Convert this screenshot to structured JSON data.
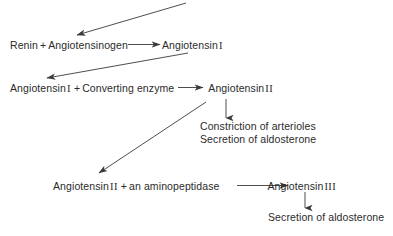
{
  "diagram": {
    "background_color": "#ffffff",
    "text_color": "#2b2b2b",
    "line_color": "#3a3a3a",
    "rows": {
      "row1": {
        "left_text": "Renin + Angiotensinogen",
        "left_part_a": "Renin",
        "left_plus": "+",
        "left_part_b": "Angiotensinogen",
        "right_label": "Angiotensin",
        "right_numeral": "I",
        "right_text": "Angiotensin I"
      },
      "row2": {
        "left_part_a": "Angiotensin",
        "left_numeral": "I",
        "left_plus": "+",
        "left_part_b": "Converting enzyme",
        "left_text": "Angiotensin I + Converting enzyme",
        "right_label": "Angiotensin",
        "right_numeral": "II",
        "right_text": "Angiotensin II"
      },
      "row3": {
        "left_part_a": "Angiotensin",
        "left_numeral": "II",
        "left_plus": "+",
        "left_part_b": "an aminopeptidase",
        "left_text": "Angiotensin II + an aminopeptidase",
        "right_label": "Angiotensin",
        "right_numeral": "III",
        "right_text": "Angiotensin III"
      }
    },
    "effects": {
      "line1": "Constriction of arterioles",
      "line2": "Secretion of aldosterone"
    },
    "final_effect": {
      "line1": "Secretion of aldosterone"
    },
    "arrows": [
      {
        "name": "feedback-arrow-to-renin",
        "from": [
          186,
          3
        ],
        "to": [
          77,
          35
        ],
        "style": "solid"
      },
      {
        "name": "reaction-arrow-angiotensinogen-to-angiotensin-i",
        "from": [
          128,
          45
        ],
        "to": [
          160,
          45
        ],
        "style": "solid"
      },
      {
        "name": "arrow-angiotensin-i-to-row2",
        "from": [
          188,
          53
        ],
        "to": [
          47,
          78
        ],
        "style": "solid"
      },
      {
        "name": "reaction-arrow-converting-enzyme-to-angiotensin-ii",
        "from": [
          178,
          88
        ],
        "to": [
          203,
          88
        ],
        "style": "solid"
      },
      {
        "name": "arrow-angiotensin-ii-to-effects",
        "from": [
          226,
          99
        ],
        "to": [
          226,
          118
        ],
        "style": "solid"
      },
      {
        "name": "arrow-angiotensin-ii-to-row3",
        "from": [
          206,
          102
        ],
        "to": [
          99,
          173
        ],
        "style": "solid"
      },
      {
        "name": "reaction-arrow-aminopeptidase-to-angiotensin-iii",
        "from": [
          237,
          186
        ],
        "to": [
          288,
          186
        ],
        "style": "solid"
      },
      {
        "name": "arrow-angiotensin-iii-to-aldosterone",
        "from": [
          305,
          192
        ],
        "to": [
          305,
          208
        ],
        "style": "solid"
      }
    ]
  }
}
